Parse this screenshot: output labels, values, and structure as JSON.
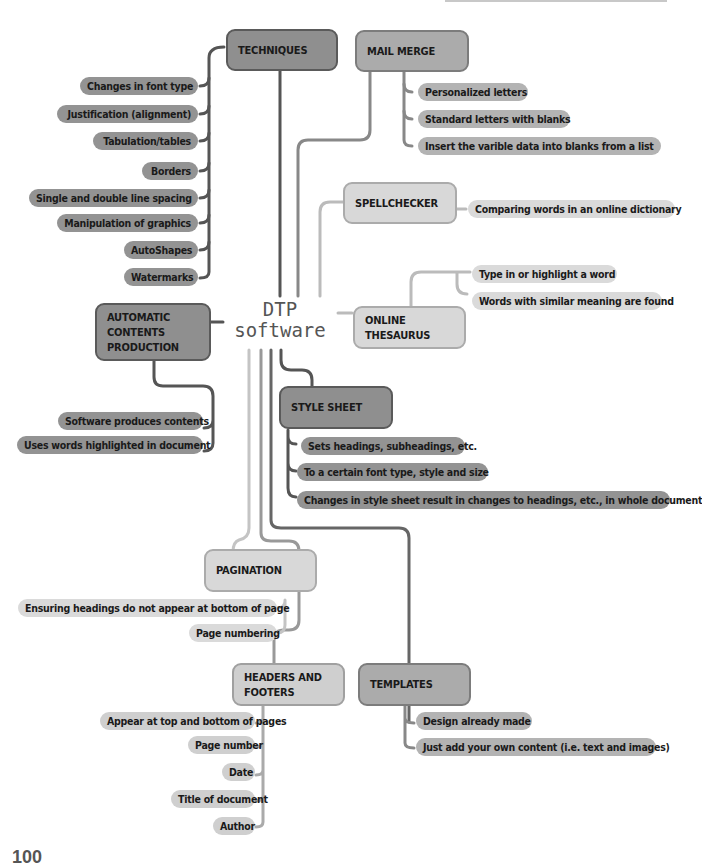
{
  "center": {
    "line1": "DTP",
    "line2": "software"
  },
  "branches": {
    "techniques": {
      "title": "TECHNIQUES",
      "items": [
        "Changes in font type",
        "Justification (alignment)",
        "Tabulation/tables",
        "Borders",
        "Single and double line spacing",
        "Manipulation of graphics",
        "AutoShapes",
        "Watermarks"
      ]
    },
    "mail_merge": {
      "title": "MAIL MERGE",
      "items": [
        "Personalized letters",
        "Standard letters with blanks",
        "Insert the varible data into blanks from a list"
      ]
    },
    "spellchecker": {
      "title": "SPELLCHECKER",
      "items": [
        "Comparing words in an online dictionary"
      ]
    },
    "online_thesaurus": {
      "title_line1": "ONLINE",
      "title_line2": "THESAURUS",
      "items": [
        "Type in or highlight a word",
        "Words with similar meaning are found"
      ]
    },
    "automatic_contents": {
      "title_line1": "AUTOMATIC",
      "title_line2": "CONTENTS",
      "title_line3": "PRODUCTION",
      "items": [
        "Software produces contents",
        "Uses words highlighted in document"
      ]
    },
    "style_sheet": {
      "title": "STYLE SHEET",
      "items": [
        "Sets headings, subheadings, etc.",
        "To a certain font type, style and size",
        "Changes in style sheet result in changes to headings, etc., in whole document"
      ]
    },
    "pagination": {
      "title": "PAGINATION",
      "items": [
        "Ensuring headings do not appear at bottom of page",
        "Page numbering"
      ]
    },
    "headers_footers": {
      "title_line1": "HEADERS AND",
      "title_line2": "FOOTERS",
      "items": [
        "Appear at top and bottom of pages",
        "Page number",
        "Date",
        "Title of document",
        "Author"
      ]
    },
    "templates": {
      "title": "TEMPLATES",
      "items": [
        "Design already made",
        "Just add your own content (i.e. text and images)"
      ]
    }
  },
  "page_number": "100",
  "colors": {
    "dark_node": "#8f8f8f",
    "mid_node": "#ababab",
    "light_node": "#d8d8d8",
    "dark_line": "#555555",
    "mid_line": "#888888",
    "light_line": "#bbbbbb"
  }
}
